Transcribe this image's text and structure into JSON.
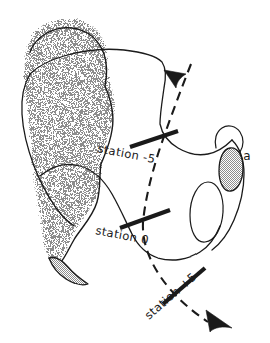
{
  "figure": {
    "background_color": "#ffffff",
    "ink_color": "#1a1a1a",
    "shading_color": "#9a9a9a",
    "width": 270,
    "height": 343
  },
  "transect": {
    "name": "dashed-transect-line",
    "style": "dashed",
    "start_arrow": "arrowhead-top",
    "end_arrow": "arrowhead-bottom",
    "direction": "upper-right to lower-right"
  },
  "stations": [
    {
      "id": "station-minus-5",
      "label": "station -5",
      "tick": "tick-mark",
      "label_rotation_deg": 11,
      "label_x": 97,
      "label_y": 152,
      "tick_x": 154,
      "tick_y": 138,
      "tick_rotation_deg": -16
    },
    {
      "id": "station-0",
      "label": "station 0",
      "tick": "tick-mark",
      "label_rotation_deg": 11,
      "label_x": 95,
      "label_y": 234,
      "tick_x": 144,
      "tick_y": 219,
      "tick_rotation_deg": -21
    },
    {
      "id": "station-plus-5",
      "label": "station +5",
      "tick": "tick-mark",
      "label_rotation_deg": -41,
      "label_x": 149,
      "label_y": 320,
      "tick_x": 185,
      "tick_y": 286,
      "tick_rotation_deg": -47
    }
  ],
  "regions": [
    {
      "id": "shaded-region-main",
      "name": "stippled-shaded-area",
      "fill": "stipple-gray",
      "edge": "feathered-top"
    },
    {
      "id": "shaded-blob-right",
      "name": "small-shaded-blob",
      "fill": "stipple-gray",
      "annotation": "a"
    },
    {
      "id": "inner-oval",
      "name": "inner-oval-outline",
      "fill": "none"
    }
  ],
  "annotations": [
    {
      "id": "blob-annotation-a",
      "text": "a",
      "x": 247,
      "y": 160
    }
  ]
}
